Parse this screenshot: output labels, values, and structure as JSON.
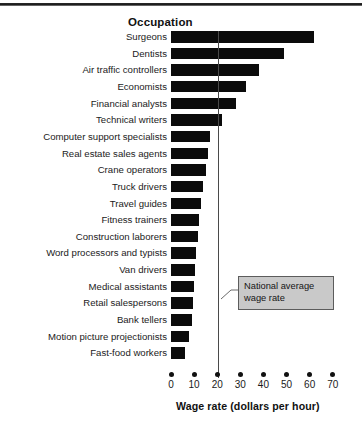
{
  "chart_data": {
    "type": "bar",
    "orientation": "horizontal",
    "title": "",
    "category_header": "Occupation",
    "xlabel": "Wage rate (dollars per hour)",
    "ylabel": "Occupation",
    "xlim": [
      0,
      74
    ],
    "xticks": [
      0,
      10,
      20,
      30,
      40,
      50,
      60,
      70
    ],
    "xtick_labels": [
      "0",
      "10",
      "20",
      "30",
      "40",
      "50",
      "60",
      "70"
    ],
    "grid": false,
    "legend": false,
    "bar_color": "#0b0b0b",
    "categories": [
      "Surgeons",
      "Dentists",
      "Air traffic controllers",
      "Economists",
      "Financial analysts",
      "Technical writers",
      "Computer support specialists",
      "Real estate sales agents",
      "Crane operators",
      "Truck drivers",
      "Travel guides",
      "Fitness trainers",
      "Construction laborers",
      "Word processors and typists",
      "Van drivers",
      "Medical assistants",
      "Retail salespersons",
      "Bank tellers",
      "Motion picture projectionists",
      "Fast-food workers"
    ],
    "values": [
      62,
      49,
      38,
      32.5,
      28,
      22,
      17,
      16,
      15,
      14,
      13,
      12,
      11.5,
      11,
      10.5,
      10,
      9.5,
      9,
      8,
      6
    ],
    "annotations": [
      {
        "name": "national-average-wage-rate",
        "text": "National average wage rate",
        "value": 20.5,
        "marker": "vertical-line"
      }
    ]
  },
  "header": {
    "occupation_label": "Occupation"
  },
  "annotation": {
    "line1": "National average",
    "line2": "wage rate"
  },
  "axis": {
    "title": "Wage rate (dollars per hour)"
  },
  "footer": {
    "bleed": ""
  }
}
